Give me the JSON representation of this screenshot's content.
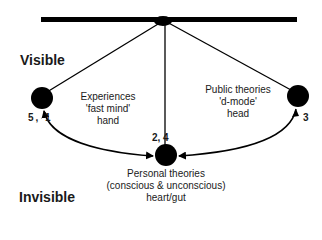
{
  "zones": {
    "visible": "Visible",
    "invisible": "Invisible"
  },
  "nodes": {
    "left": {
      "lines": [
        "Experiences",
        "'fast mind'",
        "hand"
      ],
      "step_label": "5, 1"
    },
    "right": {
      "lines": [
        "Public theories",
        "'d-mode'",
        "head"
      ],
      "step_label": "3"
    },
    "bottom": {
      "lines": [
        "Personal theories",
        "(conscious & unconscious)",
        "heart/gut"
      ],
      "step_label": "2, 4"
    }
  },
  "colors": {
    "ink": "#000000",
    "text": "#1a1a1a",
    "background": "#ffffff"
  }
}
